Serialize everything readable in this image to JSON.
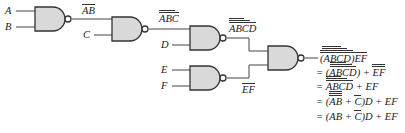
{
  "diagram": {
    "type": "logic-circuit",
    "gate_type": "NAND",
    "colors": {
      "gate_fill": "#d9d9d9",
      "wire": "#444444",
      "text": "#222222"
    },
    "inputs": [
      {
        "id": "A",
        "label": "A"
      },
      {
        "id": "B",
        "label": "B"
      },
      {
        "id": "C",
        "label": "C"
      },
      {
        "id": "D",
        "label": "D"
      },
      {
        "id": "E",
        "label": "E"
      },
      {
        "id": "F",
        "label": "F"
      }
    ],
    "gates": [
      {
        "id": "g1",
        "type": "NAND",
        "inputs": [
          "A",
          "B"
        ],
        "output_label": "AB"
      },
      {
        "id": "g2",
        "type": "NAND",
        "inputs": [
          "g1",
          "C"
        ],
        "output_label": "ABC"
      },
      {
        "id": "g3",
        "type": "NAND",
        "inputs": [
          "g2",
          "D"
        ],
        "output_label": "ABCD"
      },
      {
        "id": "g4",
        "type": "NAND",
        "inputs": [
          "E",
          "F"
        ],
        "output_label": "EF"
      },
      {
        "id": "g5",
        "type": "NAND",
        "inputs": [
          "g3",
          "g4"
        ],
        "output_label": "(ABCD)EF"
      }
    ],
    "equations": [
      {
        "prefix": "",
        "text": "(ABCD)EF"
      },
      {
        "prefix": "=",
        "text": "(ABCD) + EF"
      },
      {
        "prefix": "=",
        "text": "ABCD + EF"
      },
      {
        "prefix": "=",
        "text": "(AB + C)D + EF"
      },
      {
        "prefix": "=",
        "text": "(AB + C)D + EF"
      }
    ],
    "labels": {
      "A": "A",
      "B": "B",
      "C": "C",
      "D": "D",
      "E": "E",
      "F": "F",
      "ab": "AB",
      "abc": "ABC",
      "abcd": "ABCD",
      "ef": "EF",
      "eq_plus": "+",
      "eq_equals": "="
    }
  }
}
